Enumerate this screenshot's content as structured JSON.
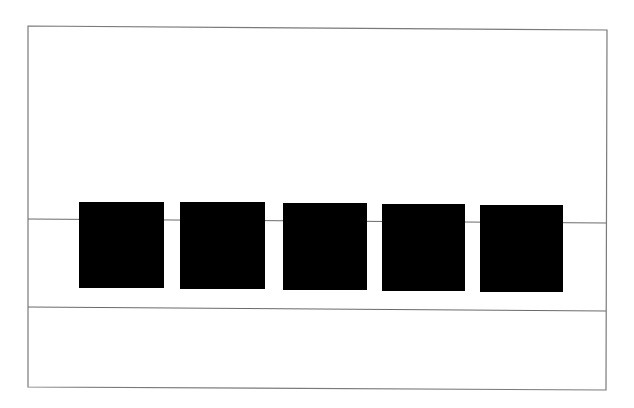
{
  "diagram": {
    "colors": {
      "background": "#ffffff",
      "frame_stroke": "#7a7a7a",
      "line_stroke": "#6a6a6a",
      "square_fill": "#000000"
    },
    "frame": {
      "x1": 28,
      "y1": 26,
      "x2": 607,
      "y2": 30,
      "x3": 606,
      "y3": 390,
      "x4": 28,
      "y4": 387
    },
    "threading_line": {
      "x1": 28,
      "y1": 219,
      "x2": 606,
      "y2": 223
    },
    "divider_line": {
      "x1": 28,
      "y1": 307,
      "x2": 606,
      "y2": 311
    },
    "squares": [
      {
        "x": 79,
        "y": 202,
        "w": 85,
        "h": 86
      },
      {
        "x": 180,
        "y": 202,
        "w": 85,
        "h": 87
      },
      {
        "x": 283,
        "y": 203,
        "w": 84,
        "h": 87
      },
      {
        "x": 382,
        "y": 204,
        "w": 83,
        "h": 87
      },
      {
        "x": 480,
        "y": 205,
        "w": 83,
        "h": 87
      }
    ]
  }
}
